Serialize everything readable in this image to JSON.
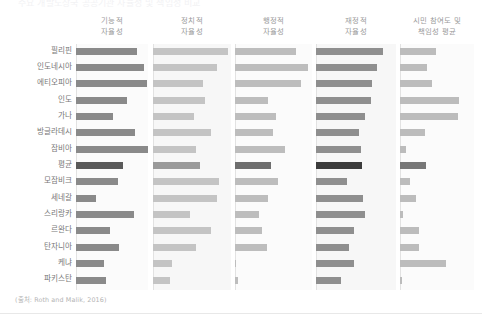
{
  "chart": {
    "title": "주요 개발도상국 공공기관 자율성 및 책임성 비교",
    "source_note": "(출처: Roth and Malik, 2016)"
  },
  "chart_data": {
    "type": "bar",
    "title": "주요 개발도상국 공공기관 자율성 및 책임성 비교",
    "subtitle": "",
    "xlabel": "",
    "ylabel": "",
    "grid": false,
    "legend_position": "none",
    "layout": "small-multiples-horizontal-bars",
    "note": "(출처: Roth and Malik, 2016)",
    "categories": [
      "필리핀",
      "인도네시아",
      "에티오피아",
      "인도",
      "가나",
      "방글라데시",
      "잠비아",
      "평균",
      "모잠비크",
      "세네갈",
      "스리랑카",
      "르완다",
      "탄자니아",
      "케냐",
      "파키스탄"
    ],
    "highlight_category": "평균",
    "xlim": [
      0,
      100
    ],
    "panels": [
      {
        "name": "기능적 자율성",
        "label_lines": [
          "기능적",
          "자율성"
        ],
        "color": "#8a8a8a",
        "highlight_color": "#5a5a5a",
        "values": [
          85,
          94,
          98,
          71,
          52,
          82,
          100,
          65,
          58,
          28,
          80,
          47,
          60,
          39,
          42
        ]
      },
      {
        "name": "정치적 자율성",
        "label_lines": [
          "정치적",
          "자율성"
        ],
        "color": "#c4c4c4",
        "highlight_color": "#9a9a9a",
        "values": [
          100,
          85,
          67,
          69,
          55,
          77,
          57,
          63,
          88,
          85,
          49,
          77,
          57,
          25,
          23
        ]
      },
      {
        "name": "행정적 자율성",
        "label_lines": [
          "행정적",
          "자율성"
        ],
        "color": "#bdbdbd",
        "highlight_color": "#6e6e6e",
        "values": [
          84,
          100,
          90,
          45,
          56,
          52,
          68,
          49,
          59,
          45,
          33,
          37,
          44,
          1,
          4
        ]
      },
      {
        "name": "재정적 자율성",
        "label_lines": [
          "재정적",
          "자율성"
        ],
        "color": "#8f8f8f",
        "highlight_color": "#3c3c3c",
        "values": [
          100,
          91,
          84,
          82,
          73,
          64,
          67,
          69,
          46,
          70,
          73,
          57,
          49,
          57,
          37
        ]
      },
      {
        "name": "시민 참여도 및 책임성 평균",
        "label_lines": [
          "시민 참여도 및",
          "책임성 평균"
        ],
        "color": "#bcbcbc",
        "highlight_color": "#777777",
        "values": [
          59,
          44,
          52,
          97,
          95,
          41,
          10,
          43,
          16,
          26,
          5,
          31,
          31,
          76,
          3
        ]
      }
    ]
  },
  "colors": {
    "background": "#ffffff",
    "panel_background": "#fbfbfb",
    "panel_background_alt": "#f7f7f7",
    "axis_line": "#e2e2e2",
    "label_text": "#787878",
    "header_text": "#9a9a9a",
    "source_text": "#b4b4b4"
  }
}
